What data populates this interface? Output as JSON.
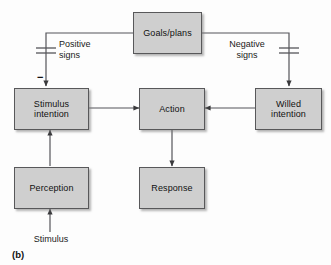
{
  "figure": {
    "caption": "(b)",
    "box_fill_color": "#cfcfcf",
    "box_border_color": "#58585a",
    "line_color": "#55555a",
    "background_color": "#fdfdfd"
  },
  "nodes": {
    "goals_plans": {
      "label": "Goals/plans"
    },
    "stimulus_intention": {
      "label": "Stimulus\nintention"
    },
    "action": {
      "label": "Action"
    },
    "willed_intention": {
      "label": "Willed\nintention"
    },
    "perception": {
      "label": "Perception"
    },
    "response": {
      "label": "Response"
    }
  },
  "edge_labels": {
    "positive_signs": "Positive\nsigns",
    "negative_signs": "Negative\nsigns",
    "minus": "−"
  },
  "free_labels": {
    "stimulus_input": "Stimulus"
  },
  "connections": [
    {
      "from": "goals_plans",
      "to": "stimulus_intention",
      "label": "Positive\nsigns",
      "gate": "capacitor"
    },
    {
      "from": "goals_plans",
      "to": "willed_intention",
      "label": "Negative\nsigns",
      "gate": "capacitor"
    },
    {
      "from": "stimulus_intention",
      "to": "action",
      "label": ""
    },
    {
      "from": "willed_intention",
      "to": "action",
      "label": ""
    },
    {
      "from": "perception",
      "to": "stimulus_intention",
      "label": ""
    },
    {
      "from": "action",
      "to": "response",
      "label": ""
    },
    {
      "from": "stimulus_input",
      "to": "perception",
      "label": ""
    }
  ]
}
